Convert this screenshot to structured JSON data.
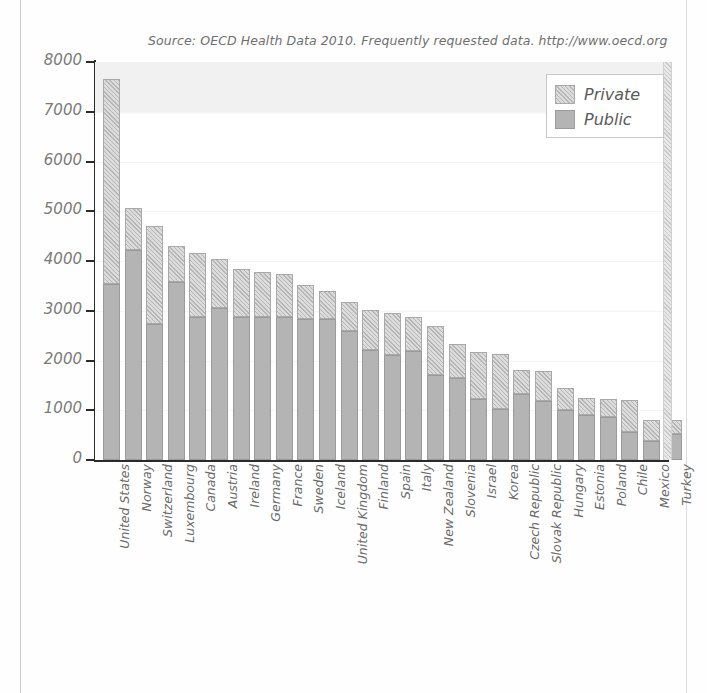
{
  "source_note": "Source: OECD Health Data 2010. Frequently requested data.  http://www.oecd.org",
  "legend": {
    "position": "top-right",
    "entries": [
      {
        "label": "Private",
        "key": "private",
        "color": "#dcdcdc"
      },
      {
        "label": "Public",
        "key": "public",
        "color": "#b4b4b4"
      }
    ]
  },
  "axis": {
    "y_ticks": [
      "8000",
      "7000",
      "6000",
      "5000",
      "4000",
      "3000",
      "2000",
      "1000",
      "0"
    ],
    "y_min": 0,
    "y_max": 8000,
    "y_step": 1000
  },
  "chart_data": {
    "type": "bar",
    "stacked": true,
    "title": "",
    "subtitle": "",
    "xlabel": "",
    "ylabel": "",
    "ylim": [
      0,
      8000
    ],
    "grid": true,
    "legend_position": "top-right",
    "categories": [
      "United States",
      "Norway",
      "Switzerland",
      "Luxembourg",
      "Canada",
      "Austria",
      "Ireland",
      "Germany",
      "France",
      "Sweden",
      "Iceland",
      "United Kingdom",
      "Finland",
      "Spain",
      "Italy",
      "New Zealand",
      "Slovenia",
      "Israel",
      "Korea",
      "Czech Republic",
      "Slovak Republic",
      "Hungary",
      "Estonia",
      "Poland",
      "Chile",
      "Mexico",
      "Turkey"
    ],
    "series": [
      {
        "name": "Public",
        "color": "#b4b4b4",
        "values": [
          3540,
          4230,
          2740,
          3580,
          2880,
          3060,
          2880,
          2880,
          2880,
          2840,
          2830,
          2600,
          2220,
          2110,
          2200,
          1700,
          1650,
          1220,
          1030,
          1320,
          1180,
          1010,
          900,
          860,
          560,
          380,
          520
        ]
      },
      {
        "name": "Private",
        "color": "#dcdcdc",
        "values": [
          4120,
          840,
          1960,
          720,
          1280,
          990,
          960,
          900,
          850,
          670,
          560,
          570,
          800,
          840,
          680,
          1000,
          690,
          950,
          1110,
          480,
          610,
          430,
          350,
          360,
          650,
          420,
          280
        ]
      }
    ],
    "totals": [
      7660,
      5070,
      4700,
      4300,
      4160,
      4050,
      3840,
      3780,
      3730,
      3510,
      3390,
      3170,
      3020,
      2950,
      2880,
      2700,
      2340,
      2170,
      2140,
      1800,
      1790,
      1440,
      1250,
      1220,
      1210,
      800,
      800
    ]
  }
}
